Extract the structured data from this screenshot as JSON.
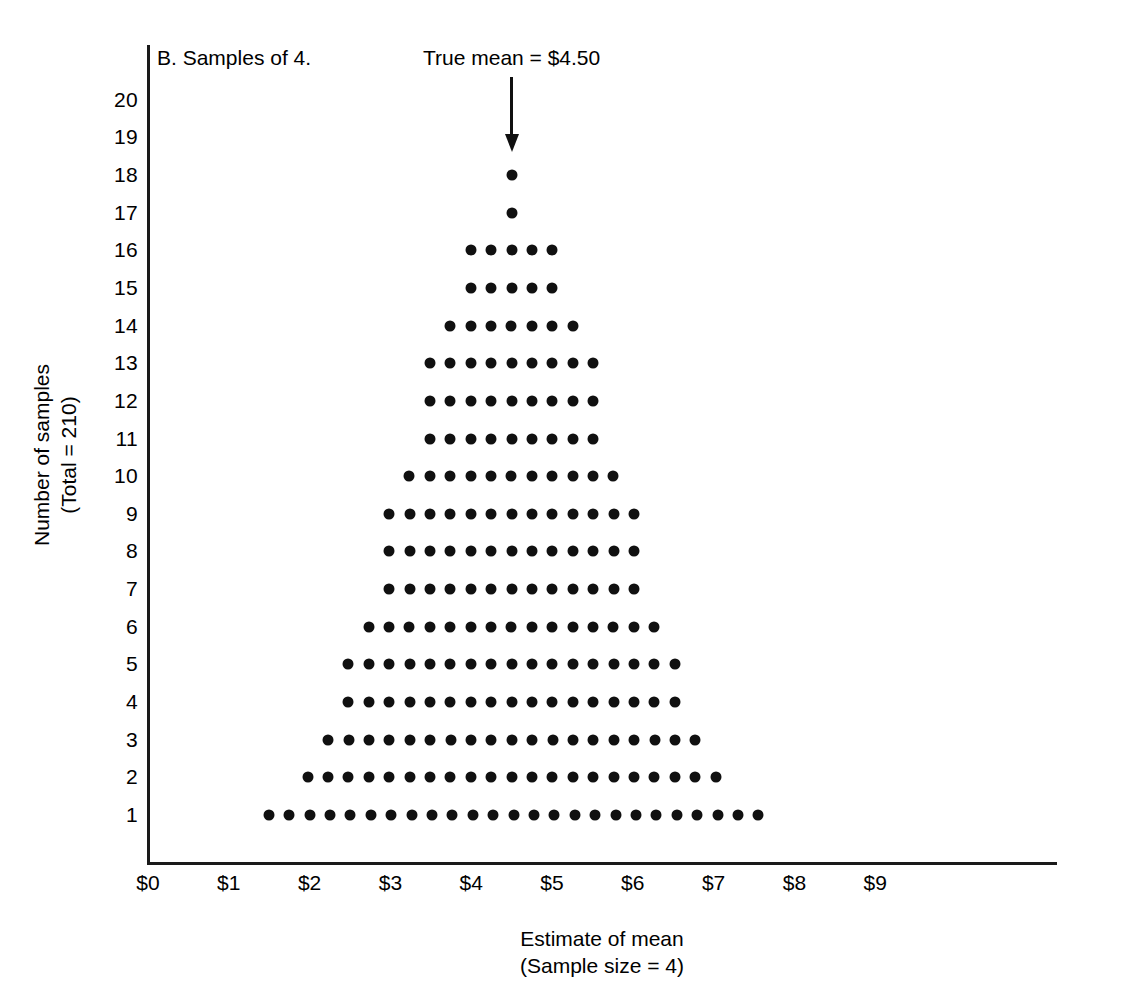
{
  "figure": {
    "panel_title": "B. Samples of 4.",
    "annotation_label": "True mean = $4.50",
    "annotation_icon": "down-arrow-icon",
    "x_axis_title_line1": "Estimate of mean",
    "x_axis_title_line2": "(Sample size = 4)",
    "y_axis_title_line1": "Number of samples",
    "y_axis_title_line2": "(Total = 210)",
    "ink_color": "#101010",
    "background_color": "#ffffff"
  },
  "chart_data": {
    "type": "scatter",
    "title": "B. Samples of 4.",
    "xlabel": "Estimate of mean (Sample size = 4)",
    "ylabel": "Number of samples (Total = 210)",
    "xlim": [
      0,
      10.5
    ],
    "ylim": [
      0,
      20.8
    ],
    "grid": false,
    "legend": null,
    "x_tick_labels": [
      "$0",
      "$1",
      "$2",
      "$3",
      "$4",
      "$5",
      "$6",
      "$7",
      "$8",
      "$9"
    ],
    "x_tick_values": [
      0,
      1,
      2,
      3,
      4,
      5,
      6,
      7,
      8,
      9
    ],
    "y_tick_labels": [
      "1",
      "2",
      "3",
      "4",
      "5",
      "6",
      "7",
      "8",
      "9",
      "10",
      "11",
      "12",
      "13",
      "14",
      "15",
      "16",
      "17",
      "18",
      "19",
      "20"
    ],
    "y_tick_values": [
      1,
      2,
      3,
      4,
      5,
      6,
      7,
      8,
      9,
      10,
      11,
      12,
      13,
      14,
      15,
      16,
      17,
      18,
      19,
      20
    ],
    "dot_step": 0.2525,
    "total_samples": 210,
    "true_mean": 4.5,
    "annotation": {
      "text": "True mean = $4.50",
      "x": 4.5,
      "y_top": 20.6,
      "y_tip": 18.6
    },
    "rows": [
      {
        "y": 1,
        "count": 25,
        "x_start": 1.495,
        "x_end": 7.555
      },
      {
        "y": 2,
        "count": 21,
        "x_start": 1.975,
        "x_end": 7.025
      },
      {
        "y": 3,
        "count": 19,
        "x_start": 2.23,
        "x_end": 6.775
      },
      {
        "y": 4,
        "count": 17,
        "x_start": 2.48,
        "x_end": 6.52
      },
      {
        "y": 5,
        "count": 17,
        "x_start": 2.48,
        "x_end": 6.52
      },
      {
        "y": 6,
        "count": 15,
        "x_start": 2.73,
        "x_end": 6.265
      },
      {
        "y": 7,
        "count": 13,
        "x_start": 2.985,
        "x_end": 6.015
      },
      {
        "y": 8,
        "count": 13,
        "x_start": 2.985,
        "x_end": 6.015
      },
      {
        "y": 9,
        "count": 13,
        "x_start": 2.985,
        "x_end": 6.015
      },
      {
        "y": 10,
        "count": 11,
        "x_start": 3.235,
        "x_end": 5.76
      },
      {
        "y": 11,
        "count": 9,
        "x_start": 3.49,
        "x_end": 5.51
      },
      {
        "y": 12,
        "count": 9,
        "x_start": 3.49,
        "x_end": 5.51
      },
      {
        "y": 13,
        "count": 9,
        "x_start": 3.49,
        "x_end": 5.51
      },
      {
        "y": 14,
        "count": 7,
        "x_start": 3.74,
        "x_end": 5.255
      },
      {
        "y": 15,
        "count": 5,
        "x_start": 3.995,
        "x_end": 5.005
      },
      {
        "y": 16,
        "count": 5,
        "x_start": 3.995,
        "x_end": 5.005
      },
      {
        "y": 17,
        "count": 1,
        "x_start": 4.5,
        "x_end": 4.5
      },
      {
        "y": 18,
        "count": 1,
        "x_start": 4.5,
        "x_end": 4.5
      },
      {
        "y": 19,
        "count": 0,
        "x_start": null,
        "x_end": null
      },
      {
        "y": 20,
        "count": 0,
        "x_start": null,
        "x_end": null
      }
    ]
  }
}
